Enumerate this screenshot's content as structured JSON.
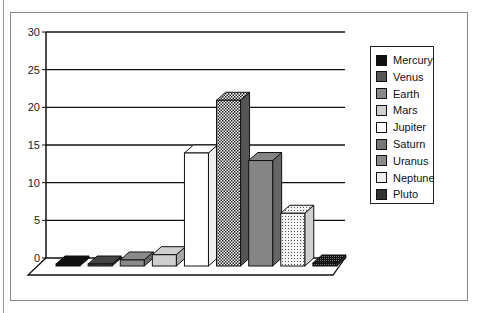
{
  "chart_data": {
    "type": "bar",
    "title": "",
    "xlabel": "",
    "ylabel": "",
    "ylim": [
      0,
      30
    ],
    "yticks": [
      "0",
      "5",
      "10",
      "15",
      "20",
      "25",
      "30"
    ],
    "grid": true,
    "legend_position": "right",
    "style": "3d",
    "categories": [
      "Mercury",
      "Venus",
      "Earth",
      "Mars",
      "Jupiter",
      "Saturn",
      "Uranus",
      "Neptune",
      "Pluto"
    ],
    "series": [
      {
        "name": "Planets",
        "values": [
          0.05,
          0.1,
          0.8,
          1.5,
          15,
          22,
          14,
          7,
          0.4
        ]
      }
    ]
  },
  "legend": {
    "items": [
      {
        "label": "Mercury",
        "fill": "#111111"
      },
      {
        "label": "Venus",
        "fill": "#444444"
      },
      {
        "label": "Earth",
        "fill": "#888888"
      },
      {
        "label": "Mars",
        "fill": "#c8c8c8"
      },
      {
        "label": "Jupiter",
        "fill": "#ffffff"
      },
      {
        "label": "Saturn",
        "fill": "#6a6a6a"
      },
      {
        "label": "Uranus",
        "fill": "#8a8a8a"
      },
      {
        "label": "Neptune",
        "fill": "#e6e6e6"
      },
      {
        "label": "Pluto",
        "fill": "#333333"
      }
    ]
  }
}
